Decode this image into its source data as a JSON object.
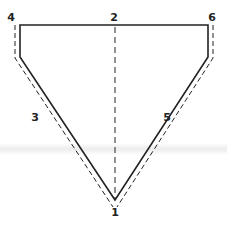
{
  "diagram": {
    "type": "fold-pattern",
    "colors": {
      "line": "#222222",
      "band": "#ececec"
    },
    "labels": [
      {
        "id": "1",
        "text": "1",
        "x": 115,
        "y": 216
      },
      {
        "id": "2",
        "text": "2",
        "x": 113,
        "y": 21
      },
      {
        "id": "3",
        "text": "3",
        "x": 35,
        "y": 121
      },
      {
        "id": "4",
        "text": "4",
        "x": 11,
        "y": 21
      },
      {
        "id": "5",
        "text": "5",
        "x": 167,
        "y": 121
      },
      {
        "id": "6",
        "text": "6",
        "x": 211,
        "y": 21
      }
    ]
  }
}
